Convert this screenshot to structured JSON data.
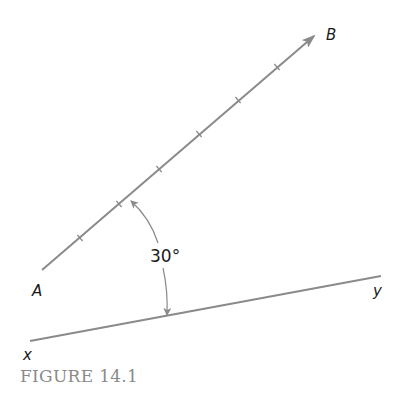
{
  "figure": {
    "caption": "FIGURE 14.1",
    "line_color": "#8a8a8a",
    "text_color": "#1a1a1a",
    "caption_color": "#8a8a8a"
  },
  "ray_ab": {
    "start_label": "A",
    "end_label": "B",
    "start": [
      42,
      270
    ],
    "end": [
      316,
      34
    ],
    "arrowhead": "end",
    "tick_marks": [
      [
        80,
        238
      ],
      [
        119,
        204
      ],
      [
        159,
        169
      ],
      [
        199,
        134
      ],
      [
        238,
        100
      ],
      [
        277,
        67
      ]
    ]
  },
  "line_xy": {
    "start_label": "x",
    "end_label": "y",
    "start": [
      30,
      341
    ],
    "end": [
      381,
      276
    ]
  },
  "angle": {
    "label": "30°",
    "value_degrees": 30,
    "between": [
      "AB",
      "xy"
    ]
  }
}
